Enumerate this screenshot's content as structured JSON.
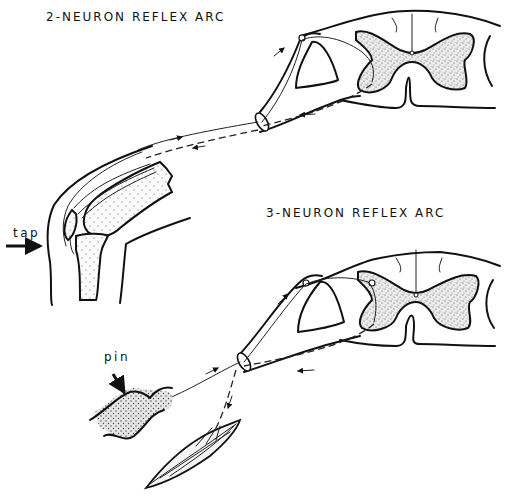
{
  "figure": {
    "type": "anatomical line drawing",
    "background": "#ffffff",
    "ink_color": "#111111"
  },
  "diagrams": [
    {
      "id": "two-neuron",
      "title": "2-NEURON REFLEX ARC",
      "stimulus_label": "tap",
      "parts": [
        "knee (patellar tendon)",
        "quadriceps muscle",
        "femur",
        "tibia",
        "spinal nerve",
        "dorsal root ganglion",
        "spinal cord cross-section",
        "grey matter"
      ],
      "arrows": [
        "afferent arrow toward cord",
        "efferent arrow away from cord",
        "tap arrow"
      ]
    },
    {
      "id": "three-neuron",
      "title": "3-NEURON REFLEX ARC",
      "stimulus_label": "pin",
      "parts": [
        "skin",
        "muscle",
        "spinal nerve",
        "dorsal root ganglion",
        "spinal cord cross-section",
        "grey matter",
        "interneuron"
      ],
      "arrows": [
        "afferent arrow toward cord",
        "efferent arrow away from cord",
        "pin arrow"
      ]
    }
  ],
  "labels": {
    "title_top": "2-NEURON REFLEX ARC",
    "title_bottom": "3-NEURON REFLEX ARC",
    "tap": "tap",
    "pin": "pin"
  }
}
